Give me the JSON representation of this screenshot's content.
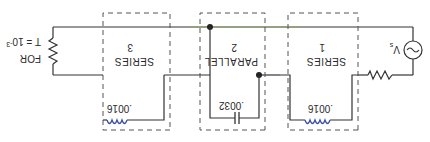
{
  "diagram": {
    "orientation": "rotated-180",
    "load": {
      "label_line1": "FOR",
      "label_line2": "T = 10",
      "label_exp": "-3"
    },
    "source": {
      "label": "V",
      "subscript": "s"
    },
    "sections": [
      {
        "id": "series-1",
        "title": "SERIES",
        "number": "1",
        "component": "inductor",
        "value": ".0016"
      },
      {
        "id": "parallel-2",
        "title": "PARALLEL",
        "number": "2",
        "component": "capacitor",
        "value": ".0032"
      },
      {
        "id": "series-3",
        "title": "SERIES",
        "number": "3",
        "component": "inductor",
        "value": ".0016"
      }
    ],
    "colors": {
      "wire": "#333333",
      "box_dash": "#555555",
      "top_wire_tint": "#8fb840",
      "inductor": "#3a4fa8",
      "capacitor_leads": "#c9c24a"
    }
  }
}
